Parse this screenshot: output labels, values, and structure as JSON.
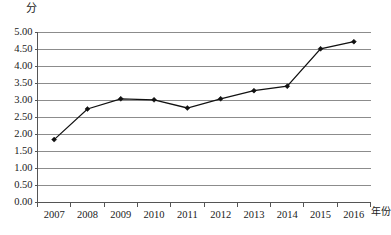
{
  "chart_data": {
    "type": "line",
    "title": "",
    "subtitle": "",
    "xlabel": "年份",
    "ylabel": "分",
    "categories": [
      "2007",
      "2008",
      "2009",
      "2010",
      "2011",
      "2012",
      "2013",
      "2014",
      "2015",
      "2016"
    ],
    "values": [
      1.85,
      2.75,
      3.05,
      3.02,
      2.78,
      3.05,
      3.29,
      3.42,
      4.52,
      4.73
    ],
    "series": [
      {
        "name": "分",
        "values": [
          1.85,
          2.75,
          3.05,
          3.02,
          2.78,
          3.05,
          3.29,
          3.42,
          4.52,
          4.73
        ]
      }
    ],
    "ylim": [
      0.0,
      5.0
    ],
    "ytick_step": 0.5,
    "ytick_labels": [
      "0.00",
      "0.50",
      "1.00",
      "1.50",
      "2.00",
      "2.50",
      "3.00",
      "3.50",
      "4.00",
      "4.50",
      "5.00"
    ],
    "ytick_values": [
      0.0,
      0.5,
      1.0,
      1.5,
      2.0,
      2.5,
      3.0,
      3.5,
      4.0,
      4.5,
      5.0
    ],
    "xtick_labels": [
      "2007",
      "2008",
      "2009",
      "2010",
      "2011",
      "2012",
      "2013",
      "2014",
      "2015",
      "2016"
    ],
    "grid": {
      "horizontal": true,
      "vertical": false,
      "color": "#808080"
    },
    "legend": {
      "visible": false,
      "position": "none",
      "entries": []
    },
    "marker": "diamond",
    "line_color": "#111111",
    "marker_color": "#111111",
    "background_color": "#ffffff",
    "axis_color": "#555555",
    "annotations": []
  },
  "axis_labels": {
    "y_unit": "分",
    "x_unit": "年份"
  }
}
